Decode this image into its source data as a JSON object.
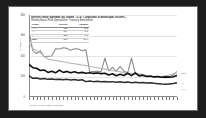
{
  "window": {
    "background_color": "#1d1d1d",
    "page_color": "#ffffff"
  },
  "chart_data": {
    "type": "line",
    "title": "Interest Rate Spreads by Grade - U.S. Corporate & Municipal Issuers, Jan 2007 to Present",
    "subtitle": "Weekly Basis-Point Spread over Treasury Benchmark",
    "xlabel": "Week Ending",
    "ylabel": "Spread (bp)",
    "grid": true,
    "legend_position": "top-left",
    "ylim": [
      0,
      800
    ],
    "yticks": [
      0,
      200,
      400,
      600,
      800
    ],
    "ytick_labels": [
      "0",
      "200",
      "400",
      "600",
      "800"
    ],
    "legend_header": [
      "Grade",
      "Current",
      "Change"
    ],
    "legend_rows": [
      {
        "name": "AAA",
        "current": "118",
        "change": "-3.2"
      },
      {
        "name": "AA",
        "current": "164",
        "change": "-5.1"
      },
      {
        "name": "A",
        "current": "243",
        "change": "-7.8"
      },
      {
        "name": "BBB",
        "current": "391",
        "change": "-11.4"
      }
    ],
    "categories": [
      "Jan-07",
      "Feb-07",
      "Mar-07",
      "Apr-07",
      "May-07",
      "Jun-07",
      "Jul-07",
      "Aug-07",
      "Sep-07",
      "Oct-07",
      "Nov-07",
      "Dec-07",
      "Jan-08",
      "Feb-08",
      "Mar-08",
      "Apr-08",
      "May-08",
      "Jun-08",
      "Jul-08",
      "Aug-08",
      "Sep-08",
      "Oct-08",
      "Nov-08",
      "Dec-08",
      "Jan-09",
      "Feb-09",
      "Mar-09",
      "Apr-09",
      "May-09",
      "Jun-09",
      "Jul-09",
      "Aug-09",
      "Sep-09",
      "Oct-09",
      "Nov-09",
      "Dec-09",
      "Jan-10",
      "Feb-10",
      "Mar-10",
      "Apr-10"
    ],
    "xtick_labels": [
      "Jan-07",
      "Mar-07",
      "May-07",
      "Jul-07",
      "Sep-07",
      "Nov-07",
      "Jan-08",
      "Mar-08",
      "May-08",
      "Jul-08",
      "Sep-08",
      "Nov-08",
      "Jan-09",
      "Mar-09",
      "May-09",
      "Jul-09",
      "Sep-09",
      "Nov-09",
      "Jan-10",
      "Mar-10"
    ],
    "series": [
      {
        "name": "BBB",
        "color": "#8c8c8c",
        "width": 1.1,
        "label_y_px": 66,
        "values": [
          640,
          452,
          425,
          452,
          392,
          398,
          400,
          470,
          468,
          480,
          474,
          456,
          470,
          468,
          452,
          460,
          246,
          248,
          250,
          248,
          380,
          255,
          288,
          250,
          300,
          252,
          236,
          380,
          232,
          224,
          218,
          206,
          200,
          196,
          192,
          190,
          188,
          196,
          214,
          246
        ]
      },
      {
        "name": "A",
        "color": "#b5b5b5",
        "width": 1.1,
        "label_y_px": 72,
        "values": [
          520,
          470,
          455,
          430,
          398,
          370,
          362,
          356,
          350,
          344,
          336,
          330,
          324,
          318,
          312,
          306,
          300,
          292,
          286,
          278,
          272,
          266,
          258,
          252,
          246,
          238,
          232,
          228,
          222,
          214,
          208,
          202,
          198,
          194,
          196,
          200,
          206,
          214,
          224,
          238
        ]
      },
      {
        "name": "AA",
        "color": "#111111",
        "width": 1.6,
        "label_y_px": 76,
        "values": [
          318,
          286,
          280,
          258,
          264,
          240,
          252,
          236,
          262,
          240,
          250,
          236,
          246,
          234,
          240,
          232,
          236,
          230,
          234,
          228,
          232,
          214,
          226,
          208,
          222,
          210,
          232,
          208,
          236,
          206,
          212,
          200,
          204,
          196,
          200,
          192,
          196,
          194,
          198,
          210
        ]
      },
      {
        "name": "AAA",
        "color": "#2e2e2e",
        "width": 1.5,
        "label_y_px": 82,
        "values": [
          206,
          182,
          186,
          176,
          180,
          172,
          176,
          170,
          174,
          168,
          172,
          166,
          170,
          164,
          168,
          150,
          156,
          150,
          154,
          148,
          152,
          146,
          150,
          144,
          148,
          142,
          146,
          140,
          144,
          138,
          142,
          136,
          140,
          134,
          130,
          126,
          124,
          128,
          132,
          140
        ]
      }
    ],
    "footnote": "Source: Weekly market composite."
  }
}
